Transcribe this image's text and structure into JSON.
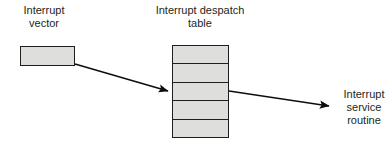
{
  "diagram": {
    "background_color": "#ffffff",
    "stroke_color": "#201d1d",
    "box_fill_color": "#dededd",
    "text_color": "#231f20",
    "labels": {
      "interrupt_vector": "Interrupt\nvector",
      "despatch_table": "Interrupt despatch\ntable",
      "service_routine": "Interrupt\nservice\nroutine"
    },
    "interrupt_vector_box": {
      "name": "interrupt-vector",
      "rows": 1
    },
    "despatch_table": {
      "name": "interrupt-despatch-table",
      "row_count": 5,
      "rows": [
        "",
        "",
        "",
        "",
        ""
      ]
    },
    "arrows": [
      {
        "name": "vector-to-table-arrow",
        "from": "interrupt-vector-box",
        "to": "despatch-table-row-3",
        "x1": 75,
        "y1": 64,
        "x2": 171,
        "y2": 92
      },
      {
        "name": "table-to-routine-arrow",
        "from": "despatch-table-row-3",
        "to": "interrupt-service-routine",
        "x1": 229,
        "y1": 91,
        "x2": 332,
        "y2": 107
      }
    ]
  }
}
